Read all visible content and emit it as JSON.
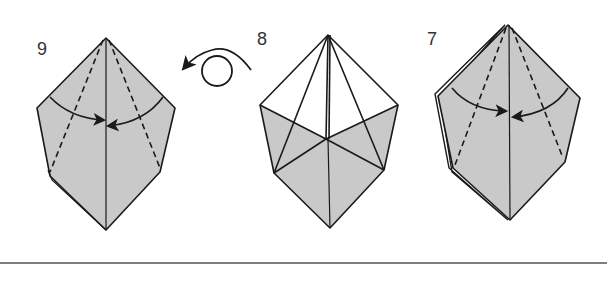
{
  "diagram": {
    "type": "origami instruction steps",
    "colors": {
      "paper_fill": "#c9c9c9",
      "line": "#1a1a1a",
      "divider": "#555555",
      "background": "#ffffff"
    },
    "steps": [
      {
        "number": "9",
        "description": "Fold both sides to the center crease along dashed valley lines",
        "arrows": [
          "curved-arrow-left-to-center",
          "curved-arrow-right-to-center"
        ]
      },
      {
        "number": "8",
        "description": "Model shown after flipping; white upper flaps with shaded lower section"
      },
      {
        "number": "7",
        "description": "Fold both sides to the center crease along dashed valley lines",
        "arrows": [
          "curved-arrow-left-to-center",
          "curved-arrow-right-to-center"
        ]
      }
    ],
    "symbols": {
      "turn_over": "turn-over-icon"
    }
  }
}
